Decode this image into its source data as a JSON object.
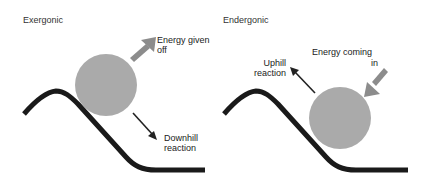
{
  "exergonic": {
    "title": "Exergonic",
    "energy_label_line1": "Energy given",
    "energy_label_line2": "off",
    "reaction_label_line1": "Downhill",
    "reaction_label_line2": "reaction"
  },
  "endergonic": {
    "title": "Endergonic",
    "energy_label_line1": "Energy coming",
    "energy_label_line2": "in",
    "reaction_label_line1": "Uphill",
    "reaction_label_line2": "reaction"
  },
  "colors": {
    "ball": "#aaaaaa",
    "energy_arrow": "#8c8c8c",
    "hill": "#1a1a1a",
    "reaction_arrow": "#222222"
  }
}
